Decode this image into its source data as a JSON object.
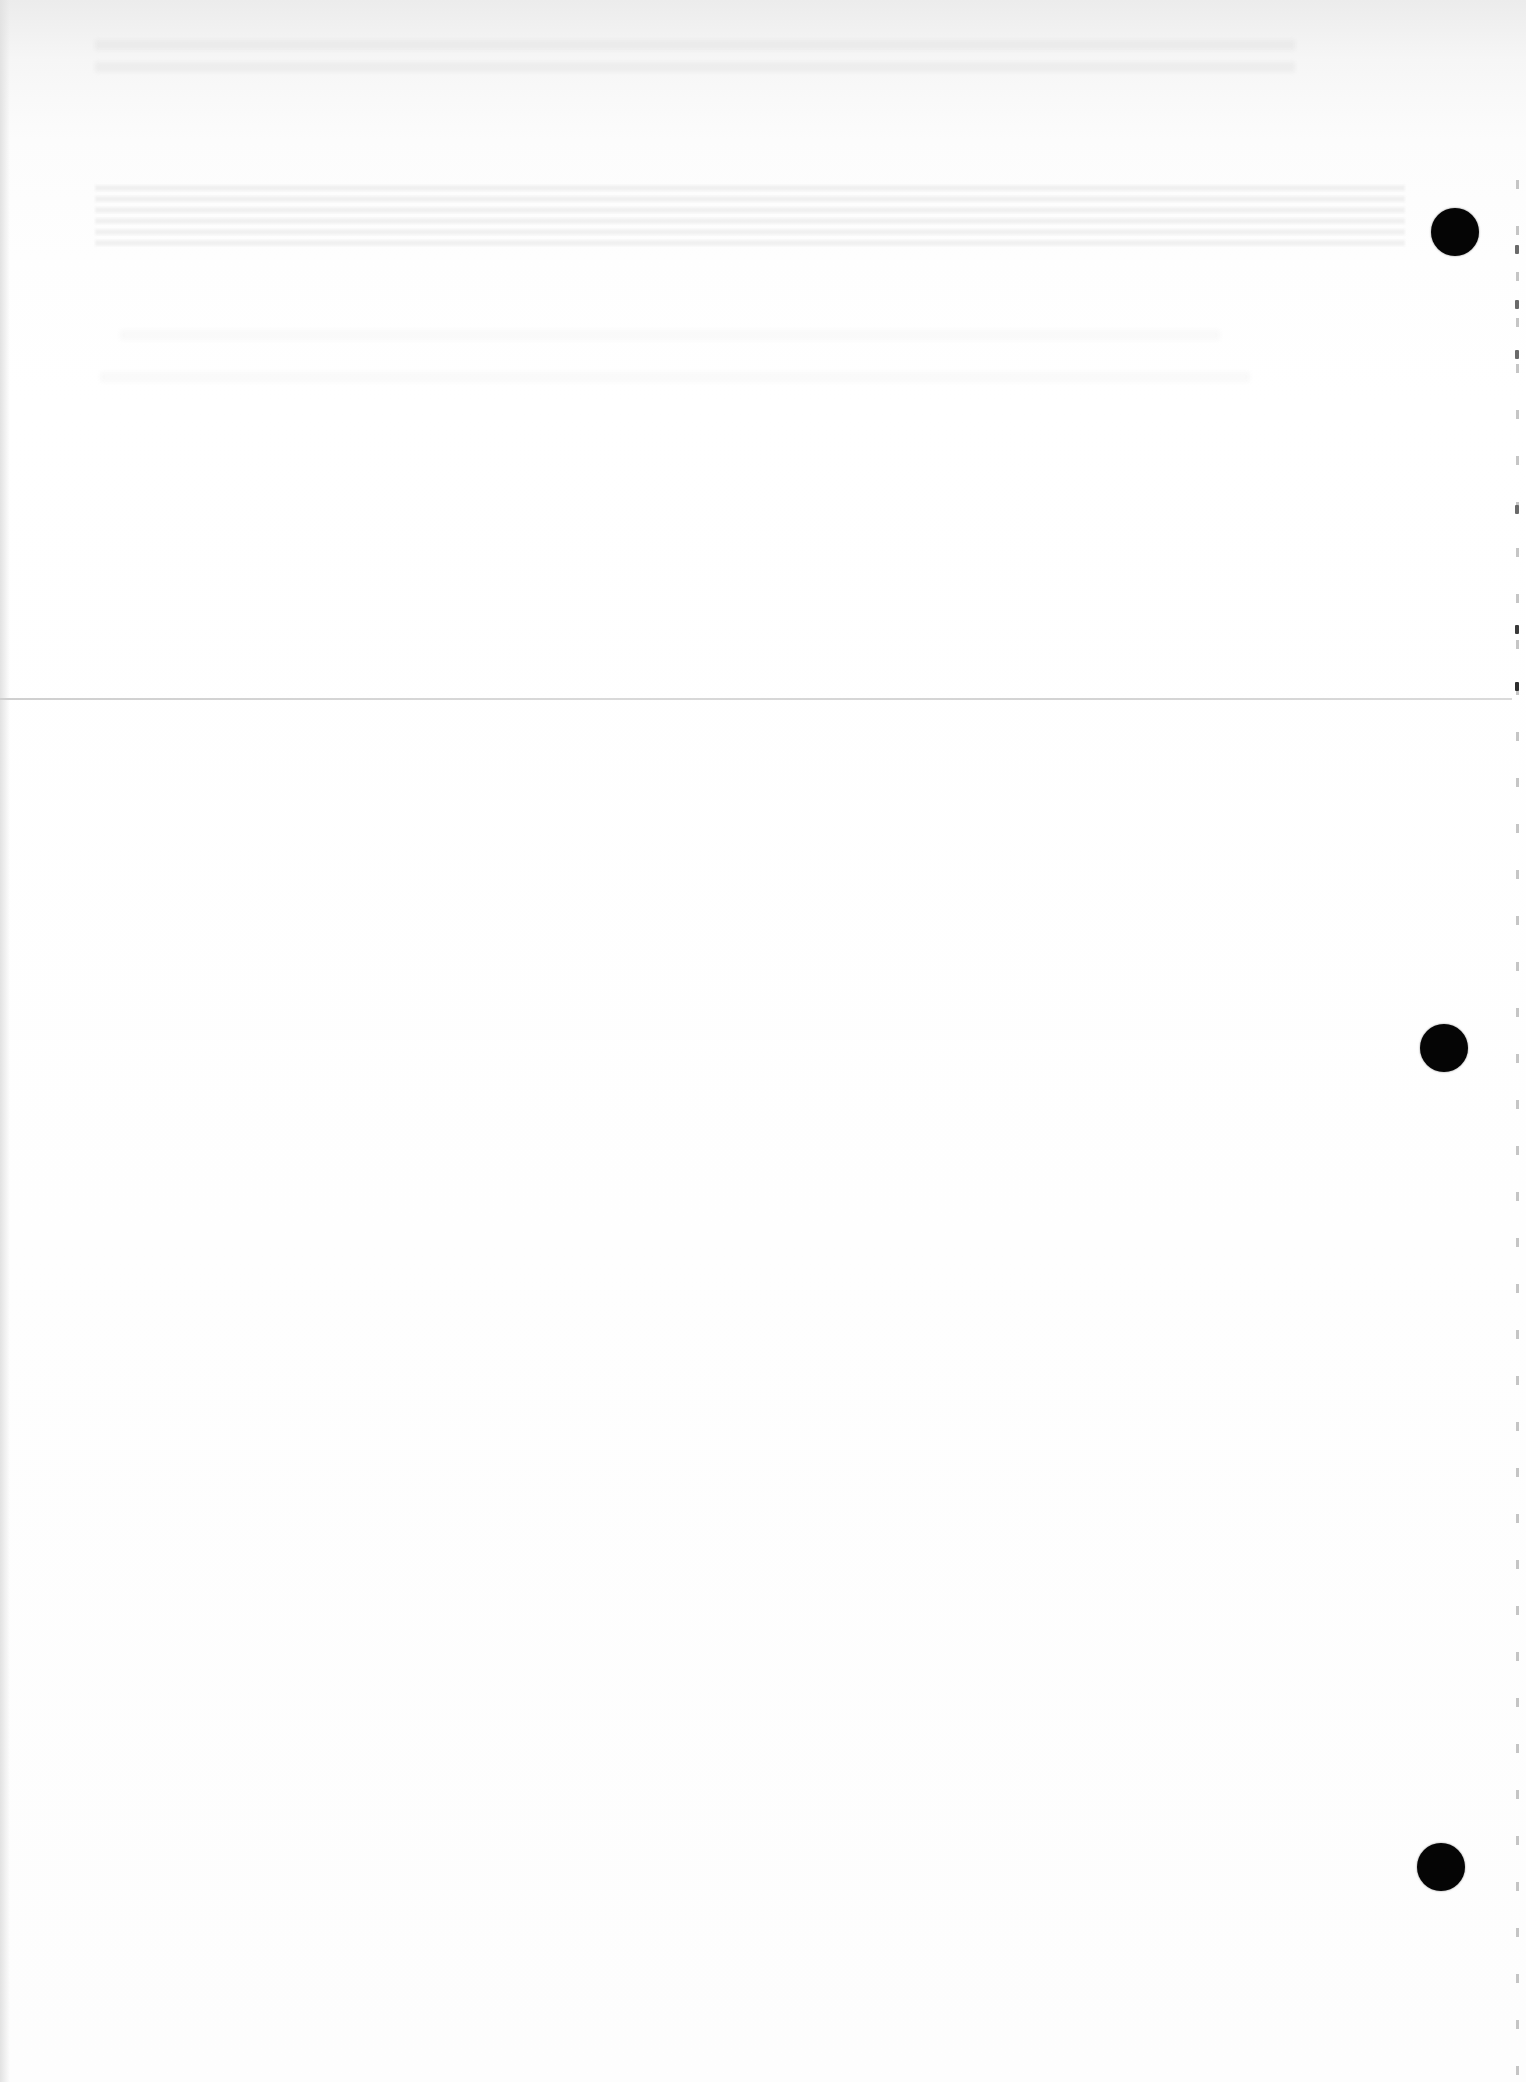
{
  "document": {
    "type": "scanned-page",
    "content_text": "",
    "background_color": "#fdfdfd",
    "fold_line": {
      "y": 698,
      "color": "#d4d4d4"
    },
    "punch_holes": [
      {
        "name": "punch-hole-top",
        "cx": 1455,
        "cy": 232,
        "r": 24
      },
      {
        "name": "punch-hole-middle",
        "cx": 1444,
        "cy": 1048,
        "r": 24
      },
      {
        "name": "punch-hole-bottom",
        "cx": 1441,
        "cy": 1867,
        "r": 24
      }
    ],
    "punch_hole_color": "#050505"
  }
}
